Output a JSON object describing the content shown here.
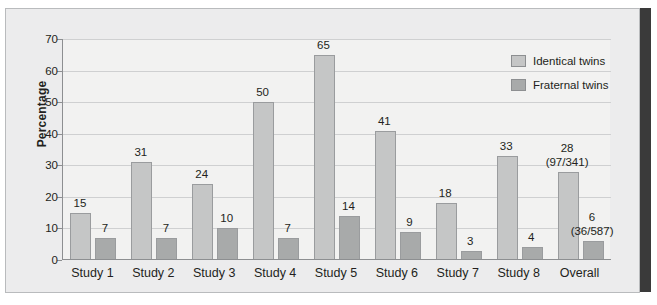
{
  "chart_data": {
    "type": "bar",
    "title": "",
    "xlabel": "",
    "ylabel": "Percentage",
    "ylim": [
      0,
      70
    ],
    "yticks": [
      0,
      10,
      20,
      30,
      40,
      50,
      60,
      70
    ],
    "grid": true,
    "legend_position": "top-right",
    "categories": [
      "Study 1",
      "Study 2",
      "Study 3",
      "Study 4",
      "Study 5",
      "Study 6",
      "Study 7",
      "Study 8",
      "Overall"
    ],
    "series": [
      {
        "name": "Identical twins",
        "color": "#c5c6c6",
        "values": [
          15,
          31,
          24,
          50,
          65,
          41,
          18,
          33,
          28
        ],
        "labels": [
          "15",
          "31",
          "24",
          "50",
          "65",
          "41",
          "18",
          "33",
          "28"
        ],
        "sublabels": [
          "",
          "",
          "",
          "",
          "",
          "",
          "",
          "",
          "(97/341)"
        ]
      },
      {
        "name": "Fraternal twins",
        "color": "#a8aaaa",
        "values": [
          7,
          7,
          10,
          7,
          14,
          9,
          3,
          4,
          6
        ],
        "labels": [
          "7",
          "7",
          "10",
          "7",
          "14",
          "9",
          "3",
          "4",
          "6"
        ],
        "sublabels": [
          "",
          "",
          "",
          "",
          "",
          "",
          "",
          "",
          "(36/587)"
        ]
      }
    ]
  },
  "axis": {
    "y_title": "Percentage",
    "y_tick_labels": [
      "0",
      "10",
      "20",
      "30",
      "40",
      "50",
      "60",
      "70"
    ]
  },
  "legend": {
    "items": [
      {
        "label": "Identical twins",
        "color": "#c5c6c6"
      },
      {
        "label": "Fraternal twins",
        "color": "#a8aaaa"
      }
    ]
  },
  "colors": {
    "identical": "#c5c6c6",
    "fraternal": "#a8aaaa",
    "panel_background": "#ececed",
    "plot_background": "#f2f2f1",
    "axis": "#8d8f91",
    "grid": "#cfd0d1",
    "text": "#231f20"
  }
}
